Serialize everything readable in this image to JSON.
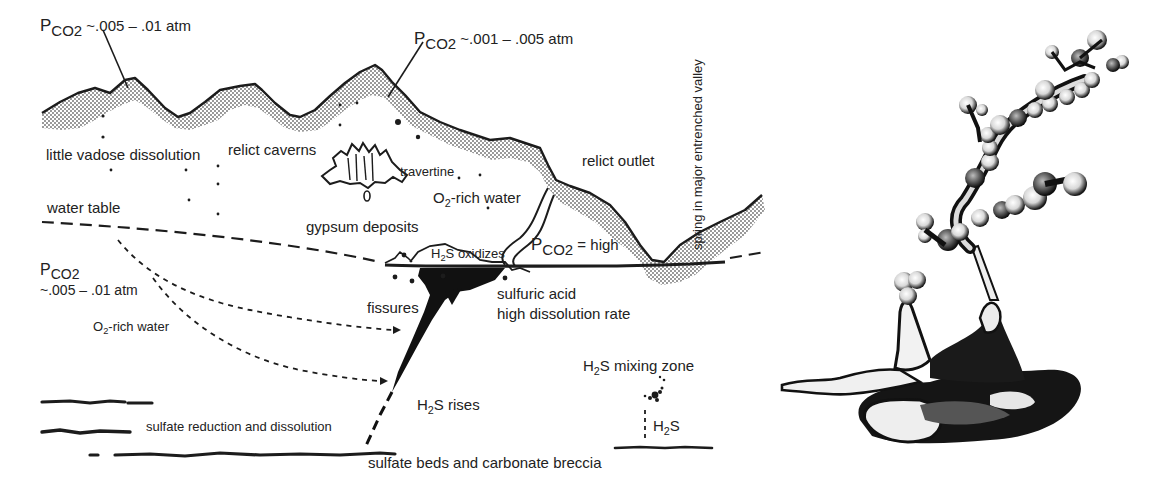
{
  "figure": {
    "type": "geologic cross-section with specimen illustration",
    "panels": [
      "cross-section",
      "specimen-drawing"
    ]
  },
  "labels": {
    "pco2_left_top": {
      "symbol": "P",
      "subscript": "CO2",
      "value": "~.005 – .01 atm"
    },
    "pco2_mid_top": {
      "symbol": "P",
      "subscript": "CO2",
      "value": "~.001 – .005 atm"
    },
    "spring": "spring in major entrenched valley",
    "little_vadose": "little vadose dissolution",
    "relict_caverns": "relict caverns",
    "travertine": "travertine",
    "relict_outlet": "relict outlet",
    "o2_rich_upper": {
      "prefix": "O",
      "subscript": "2",
      "suffix": "-rich water"
    },
    "water_table": "water table",
    "gypsum_deposits": "gypsum deposits",
    "h2s_oxidizes": {
      "prefix": "H",
      "subscript": "2",
      "suffix": "S oxidizes"
    },
    "pco2_high": {
      "symbol": "P",
      "subscript": "CO2",
      "value": "= high"
    },
    "pco2_left_mid": {
      "symbol": "P",
      "subscript": "CO2",
      "value": "~.005 – .01 atm"
    },
    "fissures": "fissures",
    "sulfuric_acid": "sulfuric acid",
    "high_dissolution": "high dissolution rate",
    "o2_rich_lower": {
      "prefix": "O",
      "subscript": "2",
      "suffix": "-rich water"
    },
    "h2s_mixing_zone": {
      "prefix": "H",
      "subscript": "2",
      "suffix": "S mixing zone"
    },
    "h2s_rises": {
      "prefix": "H",
      "subscript": "2",
      "suffix": "S rises"
    },
    "h2s_small": {
      "prefix": "H",
      "subscript": "2",
      "suffix": "S"
    },
    "sulfate_reduction": "sulfate reduction and dissolution",
    "sulfate_beds": "sulfate beds and carbonate breccia"
  },
  "colors": {
    "ink": "#1c1c1c",
    "stipple": "#8a8a8a",
    "background": "#ffffff"
  }
}
